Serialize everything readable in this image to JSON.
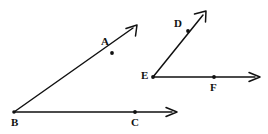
{
  "figure": {
    "kind": "hand-drawn-geometry-diagram",
    "background_color": "#ffffff",
    "ink_color": "#111111",
    "stroke_width": 1.4,
    "canvas": {
      "width": 268,
      "height": 134
    }
  },
  "angles": [
    {
      "name": "angle-ABC",
      "vertex": "B",
      "rays": [
        "ray-BA",
        "ray-BC"
      ]
    },
    {
      "name": "angle-DEF",
      "vertex": "E",
      "rays": [
        "ray-ED",
        "ray-EF"
      ]
    }
  ],
  "rays": [
    {
      "name": "ray-BA",
      "from": {
        "x": 14,
        "y": 112
      },
      "to": {
        "x": 137,
        "y": 25
      },
      "arrow_at_end": true
    },
    {
      "name": "ray-BC",
      "from": {
        "x": 14,
        "y": 112
      },
      "to": {
        "x": 177,
        "y": 112
      },
      "arrow_at_end": true
    },
    {
      "name": "ray-ED",
      "from": {
        "x": 153,
        "y": 77
      },
      "to": {
        "x": 206,
        "y": 11
      },
      "arrow_at_end": true
    },
    {
      "name": "ray-EF",
      "from": {
        "x": 153,
        "y": 77
      },
      "to": {
        "x": 260,
        "y": 77
      },
      "arrow_at_end": true
    }
  ],
  "points": [
    {
      "name": "point-B",
      "label": "B",
      "x": 14,
      "y": 112,
      "label_x": 11,
      "label_y": 117,
      "dot": false
    },
    {
      "name": "point-A",
      "label": "A",
      "x": 112,
      "y": 53,
      "label_x": 101,
      "label_y": 36,
      "dot": true
    },
    {
      "name": "point-C",
      "label": "C",
      "x": 135,
      "y": 112,
      "label_x": 131,
      "label_y": 117,
      "dot": true
    },
    {
      "name": "point-E",
      "label": "E",
      "x": 153,
      "y": 77,
      "label_x": 141,
      "label_y": 70,
      "dot": true
    },
    {
      "name": "point-D",
      "label": "D",
      "x": 188,
      "y": 31,
      "label_x": 174,
      "label_y": 18,
      "dot": true
    },
    {
      "name": "point-F",
      "label": "F",
      "x": 214,
      "y": 77,
      "label_x": 210,
      "label_y": 82,
      "dot": true
    }
  ]
}
